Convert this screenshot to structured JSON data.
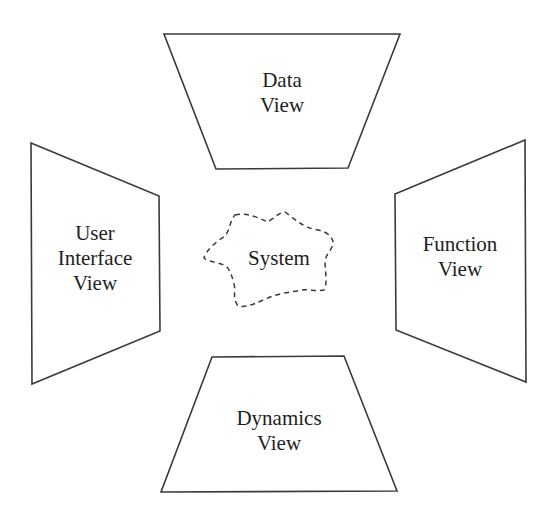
{
  "diagram": {
    "stroke_color": "#3a3a3a",
    "text_color": "#1e1e1e",
    "views": {
      "top": {
        "line1": "Data",
        "line2": "View"
      },
      "left": {
        "line1": "User",
        "line2": "Interface",
        "line3": "View"
      },
      "right": {
        "line1": "Function",
        "line2": "View"
      },
      "bottom": {
        "line1": "Dynamics",
        "line2": "View"
      }
    },
    "center": {
      "label": "System"
    }
  }
}
